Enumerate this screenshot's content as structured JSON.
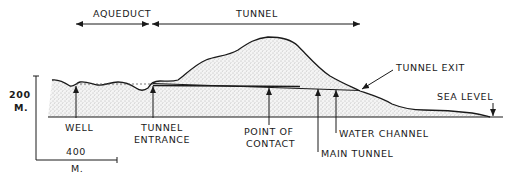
{
  "spans": {
    "aqueduct": "AQUEDUCT",
    "tunnel": "TUNNEL"
  },
  "scale": {
    "vertical_value": "200",
    "vertical_unit": "M.",
    "horizontal_value": "400",
    "horizontal_unit": "M."
  },
  "labels": {
    "well": "WELL",
    "tunnel_entrance_1": "TUNNEL",
    "tunnel_entrance_2": "ENTRANCE",
    "point_of_contact_1": "POINT OF",
    "point_of_contact_2": "CONTACT",
    "main_tunnel": "MAIN TUNNEL",
    "water_channel": "WATER CHANNEL",
    "tunnel_exit": "TUNNEL EXIT",
    "sea_level": "SEA LEVEL"
  },
  "colors": {
    "ink": "#1a1a1a",
    "stipple": "#8a8a8a",
    "background": "#ffffff"
  }
}
